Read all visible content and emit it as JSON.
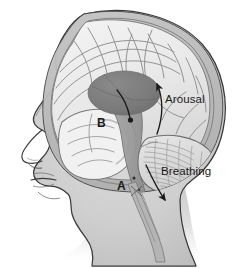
{
  "figure": {
    "kind": "anatomical-illustration",
    "view": "left lateral (facing left)",
    "background_color": "#ffffff",
    "palette": {
      "head_fill": "#cfcfcf",
      "head_outline": "#3c3c3c",
      "skull_band": "#b9b9b9",
      "cortex_fill": "#ededed",
      "cortex_line": "#8e8e8e",
      "thalamus_fill": "#7c7c7c",
      "brainstem_fill": "#9a9a9a",
      "cerebellum_fill": "#dedede",
      "arrow_color": "#1a1a1a",
      "text_color": "#1a1a1a"
    }
  },
  "labels": {
    "arousal": "Arousal",
    "breathing": "Breathing",
    "marker_a": "A",
    "marker_b": "B"
  },
  "annotations": [
    {
      "name": "arousal-arrow",
      "label": "Arousal",
      "direction": "upward",
      "description": "curved arrow sweeping up and to the left toward the cerebral cortex"
    },
    {
      "name": "breathing-arrow",
      "label": "Breathing",
      "direction": "downward",
      "description": "straight arrow angled down and to the right along the brainstem"
    },
    {
      "name": "thalamus-arrow",
      "label": "",
      "direction": "downward",
      "description": "short curved arrow from the dark oval down into the brainstem, ending in a dot"
    }
  ],
  "markers": [
    {
      "id": "A",
      "label": "A",
      "x": 120,
      "y": 187,
      "points_to": "lower brainstem / medulla"
    },
    {
      "id": "B",
      "label": "B",
      "x": 100,
      "y": 124,
      "points_to": "temporal lobe / midbrain region"
    }
  ],
  "structures": [
    {
      "name": "scalp-and-skull",
      "shading": "light gray silhouette with dark outline"
    },
    {
      "name": "face-profile",
      "features": [
        "forehead",
        "brow",
        "nose",
        "lips",
        "chin",
        "jaw",
        "neck"
      ]
    },
    {
      "name": "cerebral-cortex",
      "shading": "pale gray with gyri and sulci line work"
    },
    {
      "name": "thalamus-oval",
      "shading": "dark gray filled ellipse"
    },
    {
      "name": "brainstem",
      "shading": "medium gray column descending to spinal cord"
    },
    {
      "name": "cerebellum",
      "shading": "light gray with fine striated arbor vitae lines"
    },
    {
      "name": "spinal-cord",
      "shading": "narrow tapering gray band exiting at the neck"
    }
  ]
}
